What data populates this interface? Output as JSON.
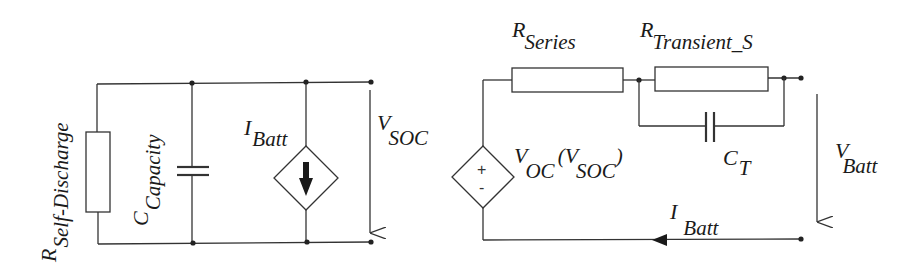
{
  "diagram": {
    "left_circuit": {
      "r_self_discharge": {
        "main": "R",
        "sub": "Self-Discharge"
      },
      "c_capacity": {
        "main": "C",
        "sub": "Capacity"
      },
      "i_batt": {
        "main": "I",
        "sub": "Batt"
      },
      "v_soc": {
        "main": "V",
        "sub": "SOC"
      }
    },
    "right_circuit": {
      "r_series": {
        "main": "R",
        "sub": "Series"
      },
      "r_transient_s": {
        "main": "R",
        "sub": "Transient_S"
      },
      "c_t": {
        "main": "C",
        "sub": "T"
      },
      "v_oc": {
        "main": "V",
        "sub": "OC",
        "paren_open": "(",
        "arg_main": "V",
        "arg_sub": "SOC",
        "paren_close": ")"
      },
      "v_batt": {
        "main": "V",
        "sub": "Batt"
      },
      "i_batt": {
        "main": "I",
        "sub": "Batt"
      },
      "source_plus": "+",
      "source_minus": "-"
    },
    "colors": {
      "line": "#333333",
      "background": "#ffffff",
      "text": "#1a1a1a"
    }
  }
}
